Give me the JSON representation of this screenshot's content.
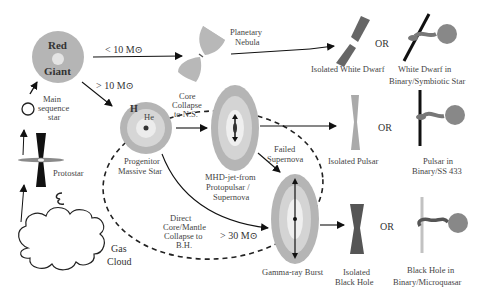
{
  "colors": {
    "gray_dark": "#7a7a7a",
    "gray_mid": "#a9a9a9",
    "gray_light": "#d0d0d0",
    "gray_pale": "#e8e8e8",
    "black": "#111111"
  },
  "nodes": {
    "gas_cloud": "Gas Cloud",
    "gas_cloud_line1": "Gas",
    "gas_cloud_line2": "Cloud",
    "protostar": "Protostar",
    "main_sequence_line1": "Main",
    "main_sequence_line2": "sequence",
    "main_sequence_line3": "star",
    "red_giant_line1": "Red",
    "red_giant_line2": "Giant",
    "planetary_nebula_line1": "Planetary",
    "planetary_nebula_line2": "Nebula",
    "progenitor_line1": "Progenitor",
    "progenitor_line2": "Massive Star",
    "progenitor_H": "H",
    "progenitor_He": "He",
    "mhd_line1": "MHD-jet-from",
    "mhd_line2": "Protopulsar /",
    "mhd_line3": "Supernova",
    "grb": "Gamma-ray Burst",
    "isolated_wd": "Isolated White Dwarf",
    "wd_binary_line1": "White Dwarf  in",
    "wd_binary_line2": "Binary/Symbiotic Star",
    "isolated_pulsar": "Isolated Pulsar",
    "pulsar_binary_line1": "Pulsar in",
    "pulsar_binary_line2": "Binary/SS 433",
    "isolated_bh_line1": "Isolated",
    "isolated_bh_line2": "Black Hole",
    "bh_binary_line1": "Black Hole in",
    "bh_binary_line2": "Binary/Microquasar"
  },
  "transitions": {
    "lt10": "< 10 M⊙",
    "gt10": "> 10 M⊙",
    "gt30": "> 30 M⊙",
    "core_collapse_line1": "Core",
    "core_collapse_line2": "Collapse",
    "core_collapse_line3": "to N.S.",
    "failed_sn_line1": "Failed",
    "failed_sn_line2": "Supernova",
    "direct_line1": "Direct",
    "direct_line2": "Core/Mantle",
    "direct_line3": "Collapse to",
    "direct_line4": "B.H."
  },
  "or_label": "OR"
}
